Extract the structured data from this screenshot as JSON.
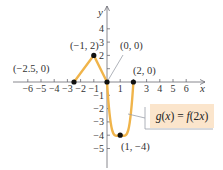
{
  "chart_data": {
    "type": "line",
    "title": "",
    "xlabel": "x",
    "ylabel": "y",
    "xlim": [
      -6.5,
      7
    ],
    "ylim": [
      -5.5,
      5.5
    ],
    "grid": false,
    "x_ticks": [
      -6,
      -5,
      -4,
      -3,
      -2,
      -1,
      1,
      2,
      3,
      4,
      5,
      6
    ],
    "x_tick_labels": [
      "−6",
      "−5",
      "−4",
      "−3",
      "−2",
      "−1",
      "1",
      "",
      "3",
      "4",
      "5",
      "6"
    ],
    "y_ticks": [
      4,
      3,
      2,
      1,
      -1,
      -2,
      -3,
      -4,
      -5
    ],
    "y_tick_labels": [
      "4",
      "3",
      "2",
      "",
      "−1",
      "−2",
      "−3",
      "−4",
      "−5"
    ],
    "series": [
      {
        "name": "g(x) = f(2x)",
        "color": "#f0b44a",
        "x": [
          -2.5,
          -1,
          0,
          1,
          2
        ],
        "y": [
          0,
          2,
          0,
          -4,
          0
        ],
        "segments": [
          "linear",
          "linear",
          "curve",
          "curve"
        ]
      }
    ],
    "annotations": [
      {
        "text": "(−2.5, 0)",
        "x": -2.5,
        "y": 0
      },
      {
        "text": "(−1, 2)",
        "x": -1,
        "y": 2
      },
      {
        "text": "(0, 0)",
        "x": 0,
        "y": 0
      },
      {
        "text": "(2, 0)",
        "x": 2,
        "y": 0
      },
      {
        "text": "(1, −4)",
        "x": 1,
        "y": -4
      }
    ],
    "legend": {
      "text": "g(x) = f(2x)",
      "position": "right",
      "box_color": "#fbe5cc"
    }
  },
  "colors": {
    "axis": "#6a6a72",
    "curve": "#f0b44a",
    "point": "#111111",
    "label_box": "#fbe5cc",
    "leader": "#9aa0a8"
  }
}
